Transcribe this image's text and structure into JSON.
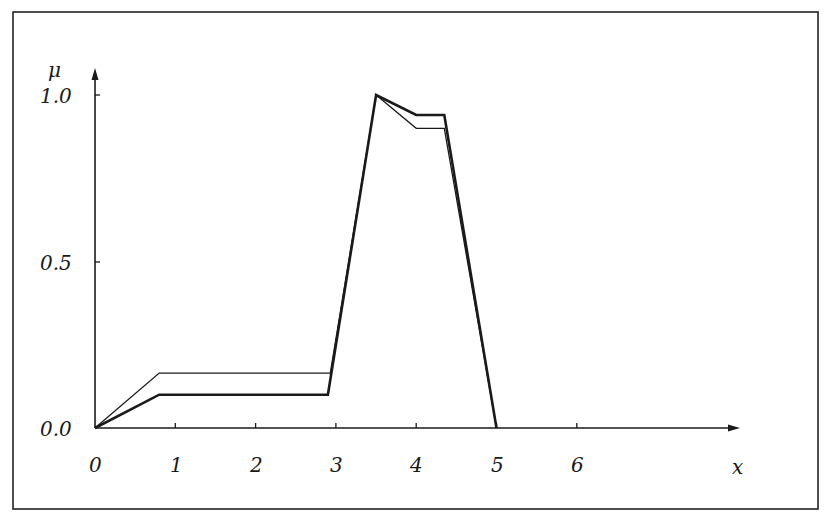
{
  "chart_data": {
    "type": "line",
    "title": "",
    "xlabel": "x",
    "ylabel": "μ",
    "xlim": [
      0,
      8
    ],
    "ylim": [
      0,
      1.0
    ],
    "grid": false,
    "legend": null,
    "x_ticks": [
      "0",
      "1",
      "2",
      "3",
      "4",
      "5",
      "6"
    ],
    "y_ticks": [
      "0.0",
      "0.5",
      "1.0"
    ],
    "series": [
      {
        "name": "thick",
        "stroke_width": 2.6,
        "x": [
          0,
          0.8,
          2.9,
          3.5,
          4.0,
          4.35,
          5.0
        ],
        "y": [
          0,
          0.1,
          0.1,
          1.0,
          0.94,
          0.94,
          0
        ]
      },
      {
        "name": "thin",
        "stroke_width": 1.3,
        "x": [
          0,
          0.8,
          2.93,
          3.5,
          4.0,
          4.35,
          5.0
        ],
        "y": [
          0,
          0.165,
          0.165,
          1.0,
          0.9,
          0.9,
          0
        ]
      }
    ]
  },
  "labels": {
    "y_axis": "μ",
    "x_axis": "x",
    "y_tick_0": "0.0",
    "y_tick_05": "0.5",
    "y_tick_1": "1.0",
    "x_tick_0": "0",
    "x_tick_1": "1",
    "x_tick_2": "2",
    "x_tick_3": "3",
    "x_tick_4": "4",
    "x_tick_5": "5",
    "x_tick_6": "6"
  },
  "colors": {
    "line": "#1a1a1a",
    "frame": "#222222",
    "background": "#ffffff"
  }
}
